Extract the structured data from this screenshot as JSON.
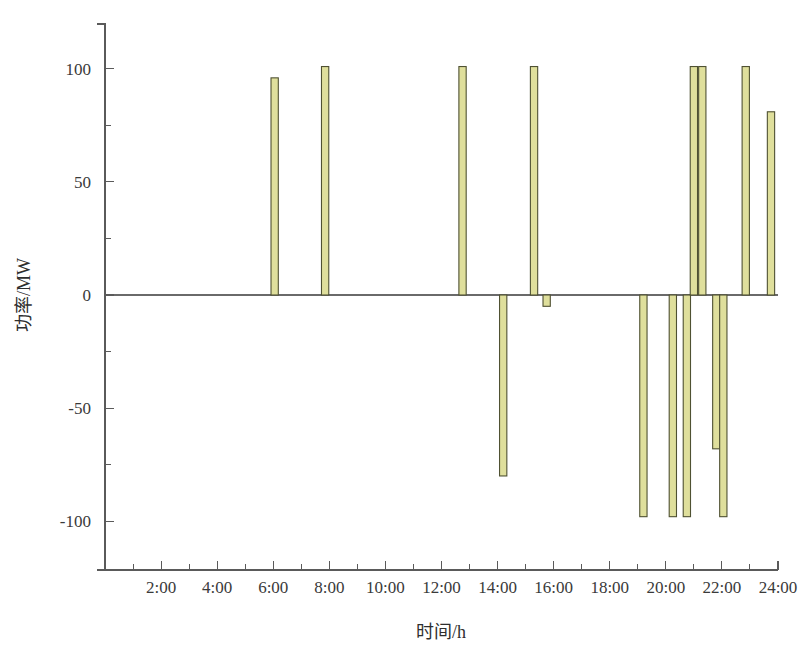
{
  "chart_data": {
    "type": "bar",
    "title": "",
    "subtitle": "",
    "xlabel": "时间/h",
    "ylabel": "功率/MW",
    "xlim": [
      0,
      24
    ],
    "ylim": [
      -112,
      116
    ],
    "grid": false,
    "legend": null,
    "x_tick_labels": [
      "2:00",
      "4:00",
      "6:00",
      "8:00",
      "10:00",
      "12:00",
      "14:00",
      "16:00",
      "18:00",
      "20:00",
      "22:00",
      "24:00"
    ],
    "x_tick_values": [
      2,
      4,
      6,
      8,
      10,
      12,
      14,
      16,
      18,
      20,
      22,
      24
    ],
    "x_minor_tick_values": [
      1,
      3,
      5,
      7,
      9,
      11,
      13,
      15,
      17,
      19,
      21,
      23
    ],
    "y_tick_labels": [
      "100",
      "50",
      "0",
      "-50",
      "-100"
    ],
    "y_tick_values": [
      100,
      50,
      0,
      -50,
      -100
    ],
    "y_minor_tick_values": [
      75,
      25,
      -25,
      -75
    ],
    "bar_fill_color": "#dfdf9c",
    "bar_edge_color": "#4f5132",
    "axis_color": "#5a5a5a",
    "bar_width_hours": 0.26,
    "x": [
      6.05,
      7.85,
      12.75,
      14.2,
      15.3,
      15.75,
      19.2,
      20.25,
      20.75,
      21.0,
      21.3,
      21.8,
      22.05,
      22.85,
      23.75
    ],
    "values": [
      96,
      101,
      101,
      -80,
      101,
      -5,
      -98,
      -98,
      -98,
      101,
      101,
      -68,
      -98,
      101,
      81
    ],
    "points": [
      {
        "time": "6:00",
        "x": 6.05,
        "value": 96
      },
      {
        "time": "8:00",
        "x": 7.85,
        "value": 101
      },
      {
        "time": "12:45",
        "x": 12.75,
        "value": 101
      },
      {
        "time": "14:15",
        "x": 14.2,
        "value": -80
      },
      {
        "time": "15:20",
        "x": 15.3,
        "value": 101
      },
      {
        "time": "15:45",
        "x": 15.75,
        "value": -5
      },
      {
        "time": "19:10",
        "x": 19.2,
        "value": -98
      },
      {
        "time": "20:15",
        "x": 20.25,
        "value": -98
      },
      {
        "time": "20:45",
        "x": 20.75,
        "value": -98
      },
      {
        "time": "21:00",
        "x": 21.0,
        "value": 101
      },
      {
        "time": "21:20",
        "x": 21.3,
        "value": 101
      },
      {
        "time": "21:50",
        "x": 21.8,
        "value": -68
      },
      {
        "time": "22:05",
        "x": 22.05,
        "value": -98
      },
      {
        "time": "22:50",
        "x": 22.85,
        "value": 101
      },
      {
        "time": "23:45",
        "x": 23.75,
        "value": 81
      }
    ]
  }
}
